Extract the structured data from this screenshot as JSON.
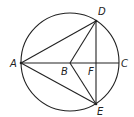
{
  "diagram": {
    "type": "geometry",
    "circle": {
      "cx": 70,
      "cy": 62,
      "r": 49
    },
    "points": {
      "A": {
        "x": 21,
        "y": 63,
        "label": "A"
      },
      "B": {
        "x": 70,
        "y": 63,
        "label": "B"
      },
      "C": {
        "x": 119,
        "y": 63,
        "label": "C"
      },
      "D": {
        "x": 96,
        "y": 21,
        "label": "D"
      },
      "E": {
        "x": 96,
        "y": 104,
        "label": "E"
      },
      "F": {
        "x": 96,
        "y": 63,
        "label": "F"
      }
    },
    "segments": [
      [
        "A",
        "C"
      ],
      [
        "A",
        "D"
      ],
      [
        "A",
        "E"
      ],
      [
        "B",
        "D"
      ],
      [
        "B",
        "E"
      ],
      [
        "D",
        "E"
      ]
    ],
    "colors": {
      "stroke": "#222222",
      "background": "#ffffff"
    }
  }
}
